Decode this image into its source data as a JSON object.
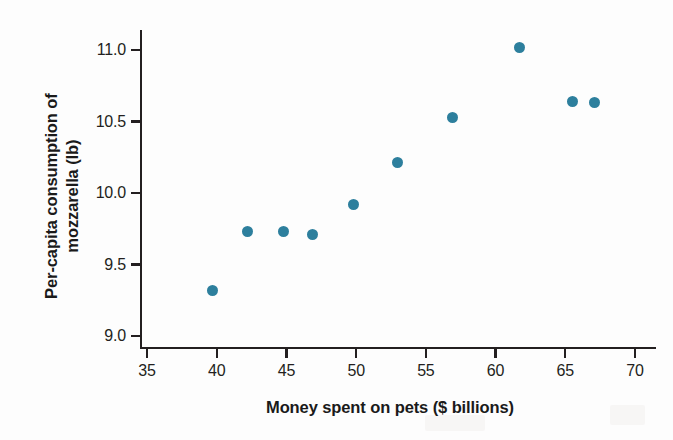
{
  "chart_data": {
    "type": "scatter",
    "title": "",
    "xlabel": "Money spent on pets ($ billions)",
    "ylabel_line1": "Per-capita consumption of",
    "ylabel_line2": "mozzarella (lb)",
    "ylabel": "Per-capita consumption of mozzarella (lb)",
    "xlim": [
      35,
      70
    ],
    "ylim": [
      9.0,
      11.0
    ],
    "xticks": [
      35,
      40,
      45,
      50,
      55,
      60,
      65,
      70
    ],
    "xtick_labels": [
      "35",
      "40",
      "45",
      "50",
      "55",
      "60",
      "65",
      "70"
    ],
    "yticks": [
      9.0,
      9.5,
      10.0,
      10.5,
      11.0
    ],
    "ytick_labels": [
      "9.0",
      "9.5",
      "10.0",
      "10.5",
      "11.0"
    ],
    "grid": false,
    "legend": null,
    "marker_color": "#2d7f9d",
    "axis_color": "#231f20",
    "x": [
      39.7,
      42.2,
      44.8,
      46.9,
      49.8,
      53.0,
      56.9,
      61.7,
      65.5,
      67.1
    ],
    "y": [
      9.32,
      9.73,
      9.73,
      9.71,
      9.92,
      10.21,
      10.53,
      11.02,
      10.64,
      10.63
    ],
    "points": [
      {
        "x": 39.7,
        "y": 9.32
      },
      {
        "x": 42.2,
        "y": 9.73
      },
      {
        "x": 44.8,
        "y": 9.73
      },
      {
        "x": 46.9,
        "y": 9.71
      },
      {
        "x": 49.8,
        "y": 9.92
      },
      {
        "x": 53.0,
        "y": 10.21
      },
      {
        "x": 56.9,
        "y": 10.53
      },
      {
        "x": 61.7,
        "y": 11.02
      },
      {
        "x": 65.5,
        "y": 10.64
      },
      {
        "x": 67.1,
        "y": 10.63
      }
    ]
  }
}
